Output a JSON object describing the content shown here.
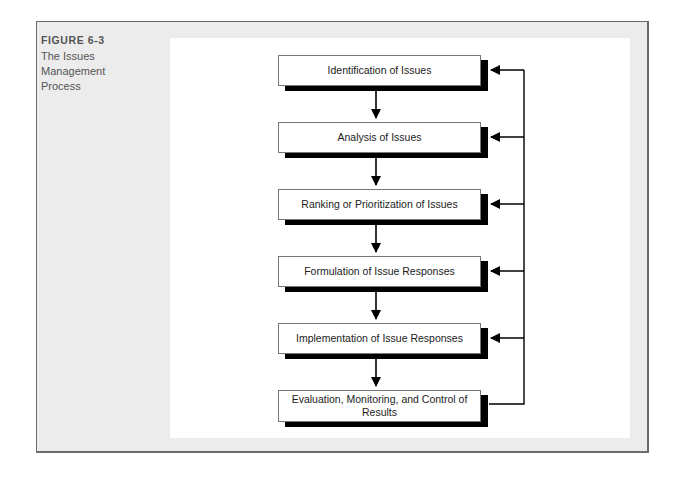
{
  "figure": {
    "number": "FIGURE 6-3",
    "title_lines": [
      "The Issues",
      "Management",
      "Process"
    ]
  },
  "diagram": {
    "type": "flowchart-with-feedback-loop",
    "steps": [
      {
        "label": "Identification of Issues"
      },
      {
        "label": "Analysis of Issues"
      },
      {
        "label": "Ranking or Prioritization of Issues"
      },
      {
        "label": "Formulation of Issue Responses"
      },
      {
        "label": "Implementation of Issue Responses"
      },
      {
        "label": "Evaluation, Monitoring, and Control of Results"
      }
    ],
    "flow": "sequential downward arrows between steps",
    "feedback": "line from final step back to every step via right-side arrows"
  }
}
